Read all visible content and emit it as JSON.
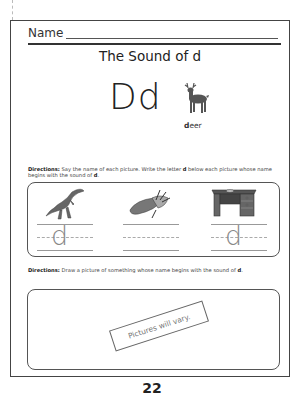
{
  "header": {
    "name_label": "Name",
    "title": "The Sound of d"
  },
  "letter_display": {
    "letters": "Dd",
    "example_word_bold": "d",
    "example_word_rest": "eer",
    "example_icon": "deer-icon"
  },
  "section1": {
    "directions_label": "Directions:",
    "directions_text": " Say the name of each picture. Write the letter ",
    "directions_letter": "d",
    "directions_text2": " below each picture whose name begins with the sound of ",
    "directions_letter2": "d",
    "directions_end": ".",
    "items": [
      {
        "picture": "dinosaur-icon",
        "answer": "d"
      },
      {
        "picture": "corn-icon",
        "answer": ""
      },
      {
        "picture": "desk-icon",
        "answer": "d"
      }
    ]
  },
  "section2": {
    "directions_label": "Directions:",
    "directions_text": " Draw a picture of something whose name begins with the sound of ",
    "directions_letter": "d",
    "directions_end": ".",
    "stamp": "Pictures will vary."
  },
  "page_number": "22",
  "colors": {
    "ink": "#222222",
    "frame": "#444444",
    "guide": "#999999"
  }
}
